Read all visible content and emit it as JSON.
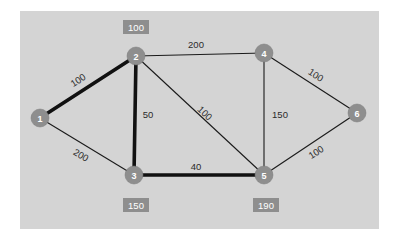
{
  "diagram": {
    "canvas": {
      "background_color": "#d4d4d4",
      "page_background_color": "#ffffff"
    },
    "colors": {
      "node_fill": "#8e8e8e",
      "node_label": "#ffffff",
      "edge": "#111111",
      "edge_label": "#2b2b2b",
      "box_fill": "#8e8e8e",
      "box_label": "#ffffff"
    },
    "nodes": [
      {
        "id": "1",
        "label": "1",
        "x": 40,
        "y": 118,
        "r": 9
      },
      {
        "id": "2",
        "label": "2",
        "x": 136,
        "y": 56,
        "r": 9
      },
      {
        "id": "3",
        "label": "3",
        "x": 134,
        "y": 175,
        "r": 9
      },
      {
        "id": "4",
        "label": "4",
        "x": 264,
        "y": 53,
        "r": 9
      },
      {
        "id": "5",
        "label": "5",
        "x": 264,
        "y": 175,
        "r": 9
      },
      {
        "id": "6",
        "label": "6",
        "x": 357,
        "y": 113,
        "r": 9
      }
    ],
    "edges": [
      {
        "from": "1",
        "to": "2",
        "weight": "100",
        "style": "thick",
        "label_x": 78,
        "label_y": 80,
        "label_rotate": -33
      },
      {
        "from": "1",
        "to": "3",
        "weight": "200",
        "style": "thin",
        "label_x": 81,
        "label_y": 155,
        "label_rotate": 31
      },
      {
        "from": "2",
        "to": "3",
        "weight": "50",
        "style": "thick",
        "label_x": 148,
        "label_y": 114,
        "label_rotate": 0
      },
      {
        "from": "2",
        "to": "4",
        "weight": "200",
        "style": "thin",
        "label_x": 196,
        "label_y": 44,
        "label_rotate": 0
      },
      {
        "from": "2",
        "to": "5",
        "weight": "100",
        "style": "thin",
        "label_x": 205,
        "label_y": 113,
        "label_rotate": 44
      },
      {
        "from": "4",
        "to": "5",
        "weight": "150",
        "style": "thin",
        "label_x": 280,
        "label_y": 114,
        "label_rotate": 0
      },
      {
        "from": "4",
        "to": "6",
        "weight": "100",
        "style": "thin",
        "label_x": 316,
        "label_y": 75,
        "label_rotate": 33
      },
      {
        "from": "5",
        "to": "6",
        "weight": "100",
        "style": "thin",
        "label_x": 316,
        "label_y": 152,
        "label_rotate": -33
      },
      {
        "from": "3",
        "to": "5",
        "weight": "40",
        "style": "thick",
        "label_x": 196,
        "label_y": 166,
        "label_rotate": 0
      }
    ],
    "value_boxes": [
      {
        "for_node": "2",
        "value": "100",
        "x": 136,
        "y": 27
      },
      {
        "for_node": "3",
        "value": "150",
        "x": 136,
        "y": 205
      },
      {
        "for_node": "5",
        "value": "190",
        "x": 266,
        "y": 205
      }
    ]
  }
}
